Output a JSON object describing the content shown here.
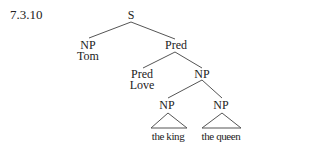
{
  "example_number": "7.3.10",
  "tree": {
    "root": "S",
    "subject": {
      "category": "NP",
      "word": "Tom"
    },
    "predicate": {
      "category": "Pred",
      "verb": {
        "category": "Pred",
        "word": "Love"
      },
      "object": {
        "category": "NP",
        "left": {
          "category": "NP",
          "word": "the king"
        },
        "right": {
          "category": "NP",
          "word": "the queen"
        }
      }
    }
  },
  "colors": {
    "line": "#555555",
    "text": "#222222"
  }
}
